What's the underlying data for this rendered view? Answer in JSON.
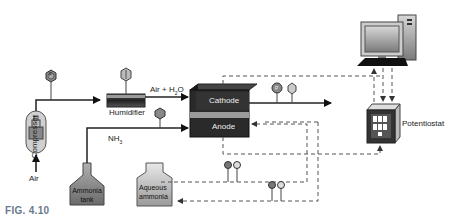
{
  "figure": {
    "caption": "FIG. 4.10"
  },
  "components": {
    "compressor": "Compressor",
    "air_input": "Air",
    "humidifier": "Humidifier",
    "air_h2o": "Air + H",
    "air_h2o_sub": "2",
    "air_h2o_tail": "O",
    "ammonia_tank_line1": "Ammonia",
    "ammonia_tank_line2": "tank",
    "nh3": "NH",
    "nh3_sub": "3",
    "cathode": "Cathode",
    "anode": "Anode",
    "aqueous_line1": "Aqueous",
    "aqueous_line2": "ammonia",
    "potentiostat": "Potentiostat"
  },
  "gauges": {
    "pressure_label": "P",
    "flow_label": "F"
  },
  "colors": {
    "cell_dark": "#2a2a2a",
    "membrane": "#9a9a9a",
    "tank_fill": "#8a8a8a",
    "line": "#222222",
    "dashed": "#666666"
  }
}
